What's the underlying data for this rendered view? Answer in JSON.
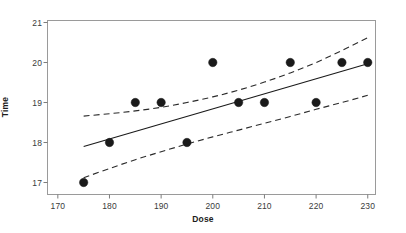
{
  "chart_data": {
    "type": "scatter",
    "title": "",
    "xlabel": "Dose",
    "ylabel": "Time",
    "xlim": [
      168,
      231.5
    ],
    "ylim": [
      16.7,
      21.05
    ],
    "xticks": [
      170,
      180,
      190,
      200,
      210,
      220,
      230
    ],
    "xtick_labels": [
      "170",
      "180",
      "190",
      "200",
      "210",
      "220",
      "230"
    ],
    "yticks": [
      17,
      18,
      19,
      20,
      21
    ],
    "ytick_labels": [
      "17",
      "18",
      "19",
      "20",
      "21"
    ],
    "grid": false,
    "legend": "none",
    "x": [
      175,
      180,
      185,
      190,
      195,
      200,
      205,
      210,
      215,
      220,
      225,
      230
    ],
    "y": [
      17,
      18,
      19,
      19,
      18,
      20,
      19,
      19,
      20,
      19,
      20,
      20
    ],
    "points": [
      {
        "x": 175,
        "y": 17
      },
      {
        "x": 180,
        "y": 18
      },
      {
        "x": 185,
        "y": 19
      },
      {
        "x": 190,
        "y": 19
      },
      {
        "x": 195,
        "y": 18
      },
      {
        "x": 200,
        "y": 20
      },
      {
        "x": 205,
        "y": 19
      },
      {
        "x": 210,
        "y": 19
      },
      {
        "x": 215,
        "y": 20
      },
      {
        "x": 220,
        "y": 19
      },
      {
        "x": 225,
        "y": 20
      },
      {
        "x": 230,
        "y": 20
      }
    ],
    "series": [
      {
        "name": "fit-line",
        "style": "solid",
        "x": [
          175,
          230
        ],
        "values": [
          17.9,
          19.97
        ]
      },
      {
        "name": "upper-confidence-band",
        "style": "dashed",
        "x": [
          175,
          180,
          185,
          190,
          195,
          200,
          205,
          210,
          215,
          220,
          225,
          230
        ],
        "values": [
          18.66,
          18.72,
          18.79,
          18.88,
          19.0,
          19.14,
          19.31,
          19.51,
          19.74,
          20.0,
          20.3,
          20.62
        ]
      },
      {
        "name": "lower-confidence-band",
        "style": "dashed",
        "x": [
          175,
          180,
          185,
          190,
          195,
          200,
          205,
          210,
          215,
          220,
          225,
          230
        ],
        "values": [
          17.12,
          17.35,
          17.57,
          17.77,
          17.96,
          18.14,
          18.31,
          18.48,
          18.65,
          18.83,
          19.0,
          19.18
        ]
      }
    ],
    "marker": {
      "shape": "circle",
      "color": "#1a1a1a",
      "size": 4.2
    },
    "colors": {
      "fit_line": "#1a1a1a",
      "band_line": "#2b2b2b",
      "frame": "#9a9a9a",
      "text": "#1c1c1c",
      "background": "#ffffff"
    }
  },
  "axes": {
    "x_title": "Dose",
    "y_title": "Time"
  }
}
